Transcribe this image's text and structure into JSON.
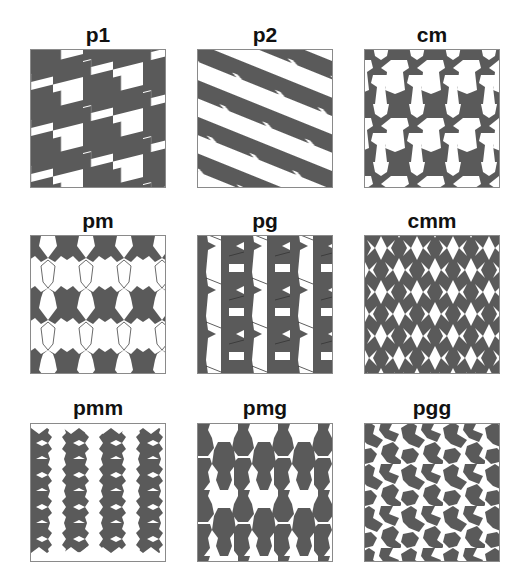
{
  "figure": {
    "fill_color": "#5a5a5a",
    "background_color": "#ffffff",
    "border_color": "#8a8a8a",
    "edge_color": "#444444"
  },
  "panels": [
    {
      "label": "p1",
      "x": 30,
      "y_title": 24,
      "y_panel": 49,
      "kind": "p1"
    },
    {
      "label": "p2",
      "x": 197,
      "y_title": 24,
      "y_panel": 49,
      "kind": "p2"
    },
    {
      "label": "cm",
      "x": 364,
      "y_title": 24,
      "y_panel": 49,
      "kind": "cm"
    },
    {
      "label": "pm",
      "x": 30,
      "y_title": 210,
      "y_panel": 235,
      "kind": "pm"
    },
    {
      "label": "pg",
      "x": 197,
      "y_title": 210,
      "y_panel": 235,
      "kind": "pg"
    },
    {
      "label": "cmm",
      "x": 364,
      "y_title": 210,
      "y_panel": 235,
      "kind": "cmm"
    },
    {
      "label": "pmm",
      "x": 30,
      "y_title": 397,
      "y_panel": 423,
      "kind": "pmm"
    },
    {
      "label": "pmg",
      "x": 197,
      "y_title": 397,
      "y_panel": 423,
      "kind": "pmg"
    },
    {
      "label": "pgg",
      "x": 364,
      "y_title": 397,
      "y_panel": 423,
      "kind": "pgg"
    }
  ]
}
